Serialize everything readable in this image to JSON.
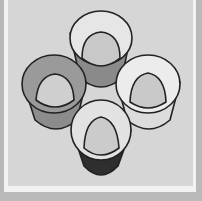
{
  "illustration": {
    "subject": "four cups arranged in a diamond, viewed from above at an angle",
    "colors": {
      "outer_margin": "#b9b9b9",
      "frame": "#f2f2f2",
      "panel_background": "#d6d6d6",
      "outline": "#222222"
    },
    "cups": [
      {
        "position": "top",
        "rim_fill": "#e6e6e6",
        "inner_fill": "#c8c8c8",
        "body_fill": "#8a8a8a"
      },
      {
        "position": "left",
        "rim_fill": "#9a9a9a",
        "inner_fill": "#cfcfcf",
        "body_fill": "#8c8c8c"
      },
      {
        "position": "right",
        "rim_fill": "#ececec",
        "inner_fill": "#c9c9c9",
        "body_fill": "#dcdcdc"
      },
      {
        "position": "bottom",
        "rim_fill": "#e2e2e2",
        "inner_fill": "#cbcbcb",
        "body_fill": "#2e2e2e"
      }
    ]
  }
}
